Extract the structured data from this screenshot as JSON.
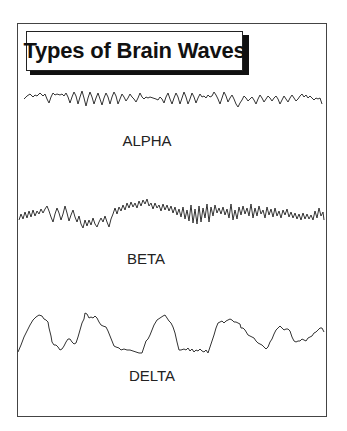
{
  "diagram": {
    "title": "Types of Brain Waves",
    "colors": {
      "stroke": "#333333",
      "text": "#111111",
      "background": "#ffffff",
      "frame": "#444444",
      "shadow": "#111111"
    },
    "waves": [
      {
        "id": "alpha",
        "label": "ALPHA",
        "description": "moderate frequency, moderate amplitude rhythmic wave"
      },
      {
        "id": "beta",
        "label": "BETA",
        "description": "high frequency, low-to-moderate amplitude irregular wave"
      },
      {
        "id": "delta",
        "label": "DELTA",
        "description": "low frequency, high amplitude slow wave"
      }
    ]
  }
}
